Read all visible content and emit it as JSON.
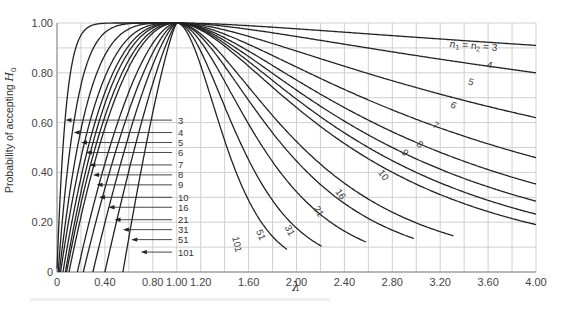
{
  "chart_data": {
    "type": "line",
    "title": "",
    "xlabel": "λ",
    "ylabel": "Probability of accepting H0",
    "xlim": [
      0,
      4.0
    ],
    "ylim": [
      0,
      1.0
    ],
    "grid": true,
    "x_ticks": [
      "0",
      "0.40",
      "0.80",
      "1.00",
      "1.20",
      "1.60",
      "2.00",
      "2.40",
      "2.80",
      "3.20",
      "3.60",
      "4.00"
    ],
    "x_tick_values": [
      0,
      0.4,
      0.8,
      1.0,
      1.2,
      1.6,
      2.0,
      2.4,
      2.8,
      3.2,
      3.6,
      4.0
    ],
    "y_ticks": [
      "0",
      "0.20",
      "0.40",
      "0.60",
      "0.80",
      "1.00"
    ],
    "y_tick_values": [
      0,
      0.2,
      0.4,
      0.6,
      0.8,
      1.0
    ],
    "legend_position": "inline labels on curves",
    "series_label_header": "n1 = n2 = 3",
    "series": [
      {
        "name": "3",
        "left_label_y": 0.61,
        "left_arrow_x": 0.07,
        "right_label": "n1 = n2 = 3",
        "value_at_4": 0.91,
        "left_zero_x": 0.0,
        "left_half_x": 0.05,
        "right_half_x": null
      },
      {
        "name": "4",
        "left_label_y": 0.56,
        "left_arrow_x": 0.14,
        "right_label": "4",
        "value_at_4": 0.8,
        "left_zero_x": 0.01,
        "left_half_x": 0.11,
        "right_half_x": null
      },
      {
        "name": "5",
        "left_label_y": 0.52,
        "left_arrow_x": 0.2,
        "right_label": "5",
        "value_at_4": 0.62,
        "left_zero_x": 0.02,
        "left_half_x": 0.17,
        "right_half_x": null
      },
      {
        "name": "6",
        "left_label_y": 0.48,
        "left_arrow_x": 0.24,
        "right_label": "6",
        "value_at_4": 0.44,
        "left_zero_x": 0.03,
        "left_half_x": 0.22,
        "right_half_x": 3.7
      },
      {
        "name": "7",
        "left_label_y": 0.43,
        "left_arrow_x": 0.27,
        "right_label": "7",
        "value_at_4": 0.29,
        "left_zero_x": 0.05,
        "left_half_x": 0.26,
        "right_half_x": 3.1
      },
      {
        "name": "8",
        "left_label_y": 0.39,
        "left_arrow_x": 0.3,
        "right_label": "8",
        "value_at_4": 0.2,
        "left_zero_x": 0.07,
        "left_half_x": 0.29,
        "right_half_x": 2.8
      },
      {
        "name": "9",
        "left_label_y": 0.35,
        "left_arrow_x": 0.33,
        "right_label": "9",
        "value_at_4": 0.08,
        "left_zero_x": 0.08,
        "left_half_x": 0.32,
        "right_half_x": 2.6
      },
      {
        "name": "10",
        "left_label_y": 0.3,
        "left_arrow_x": 0.35,
        "right_label": "10",
        "value_at_4": 0.01,
        "left_zero_x": 0.1,
        "left_half_x": 0.35,
        "right_half_x": 2.45
      },
      {
        "name": "16",
        "left_label_y": 0.26,
        "left_arrow_x": 0.43,
        "right_label": "16",
        "value_at_4": 0.0,
        "left_zero_x": 0.17,
        "left_half_x": 0.44,
        "right_half_x": 2.05
      },
      {
        "name": "21",
        "left_label_y": 0.21,
        "left_arrow_x": 0.48,
        "right_label": "21",
        "value_at_4": 0.0,
        "left_zero_x": 0.22,
        "left_half_x": 0.5,
        "right_half_x": 1.9
      },
      {
        "name": "31",
        "left_label_y": 0.17,
        "left_arrow_x": 0.55,
        "right_label": "31",
        "value_at_4": 0.0,
        "left_zero_x": 0.3,
        "left_half_x": 0.57,
        "right_half_x": 1.72
      },
      {
        "name": "51",
        "left_label_y": 0.13,
        "left_arrow_x": 0.62,
        "right_label": "51",
        "value_at_4": 0.0,
        "left_zero_x": 0.4,
        "left_half_x": 0.65,
        "right_half_x": 1.55
      },
      {
        "name": "101",
        "left_label_y": 0.08,
        "left_arrow_x": 0.7,
        "right_label": "101",
        "value_at_4": 0.0,
        "left_zero_x": 0.55,
        "left_half_x": 0.74,
        "right_half_x": 1.42
      }
    ],
    "annotations": [
      "Curves labeled by n1 = n2 sample size: 3, 4, 5, 6, 7, 8, 9, 10, 16, 21, 31, 51, 101",
      "All curves peak at 1.00 when λ = 1.00"
    ]
  },
  "axis": {
    "y_label_main": "Probability of accepting ",
    "y_label_sym": "H",
    "y_label_sub": "0",
    "x_label": "λ"
  },
  "right_labels": {
    "n3_prefix": "n",
    "n3_sub1": "1",
    "n3_eq": " = n",
    "n3_sub2": "2",
    "n3_suffix": " = 3"
  }
}
